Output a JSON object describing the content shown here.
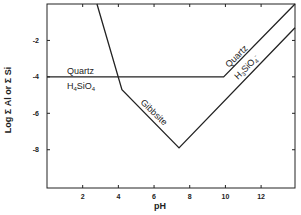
{
  "chart_data": {
    "type": "line",
    "title": "",
    "xlabel": "pH",
    "ylabel": "Log Σ Al or Σ Si",
    "xlim": [
      0,
      13.9
    ],
    "ylim": [
      -10.1,
      0
    ],
    "x_ticks": [
      2,
      4,
      6,
      8,
      10,
      12
    ],
    "x_tick_labels": [
      "2",
      "4",
      "6",
      "8",
      "10",
      "12"
    ],
    "y_ticks": [
      -2,
      -4,
      -6,
      -8
    ],
    "y_tick_labels": [
      "-2",
      "-4",
      "-6",
      "-8"
    ],
    "grid": false,
    "legend": "none",
    "series": [
      {
        "name": "Quartz solubility",
        "points": [
          [
            0,
            -4.0
          ],
          [
            9.9,
            -4.0
          ],
          [
            13.9,
            0.0
          ]
        ]
      },
      {
        "name": "Gibbsite solubility",
        "points": [
          [
            2.8,
            0.0
          ],
          [
            4.2,
            -4.7
          ],
          [
            7.4,
            -7.9
          ],
          [
            13.9,
            -1.3
          ]
        ]
      }
    ],
    "annotations": [
      {
        "text": "Quartz",
        "x": 2.0,
        "y": -3.5
      },
      {
        "text": "H4SiO4",
        "x": 2.0,
        "y": -4.6
      },
      {
        "text": "Gibbsite",
        "x": 6.0,
        "y": -6.0
      },
      {
        "text": "Quartz",
        "x": 11.2,
        "y": -1.9
      },
      {
        "text": "H3SiO4-",
        "x": 12.0,
        "y": -2.5
      }
    ]
  },
  "labels": {
    "xlabel": "pH",
    "ylabel": "Log Σ Al or Σ Si",
    "quartz_left": "Quartz",
    "h4sio4_main": "H",
    "h4sio4_sub1": "4",
    "h4sio4_mid": "SiO",
    "h4sio4_sub2": "4",
    "gibbsite": "Gibbsite",
    "quartz_right": "Quartz",
    "h3sio4_main": "H",
    "h3sio4_sub1": "3",
    "h3sio4_mid": "SiO",
    "h3sio4_sub2": "4",
    "h3sio4_sup": "-"
  }
}
